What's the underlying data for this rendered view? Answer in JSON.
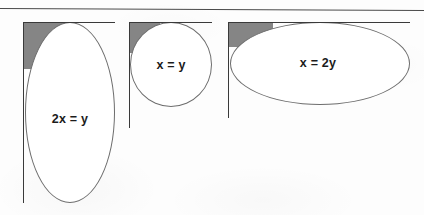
{
  "page": {
    "background_color": "#fdfdfd",
    "width": 424,
    "height": 215,
    "top_rule_color": "#4a4a4a"
  },
  "palette": {
    "bounding_box_grey": "#858585",
    "shape_fill": "#ffffff",
    "shape_outline": "#6d6d6d",
    "axis_line": "#3a3a3a",
    "label_text": "#1b1b1b"
  },
  "figures": [
    {
      "id": "tall-ellipse",
      "label": "2x = y",
      "description": "tall vertical ellipse with grey bounding corner",
      "axis_v": {
        "x": 23,
        "y": 22,
        "height": 181
      },
      "axis_h": {
        "x": 23,
        "y": 22,
        "width": 92
      },
      "bbox": {
        "x": 24,
        "y": 23,
        "width": 46,
        "height": 46
      },
      "shape": {
        "x": 25,
        "y": 22,
        "width": 90,
        "height": 181
      },
      "label_pos": {
        "x": 70,
        "y": 119
      }
    },
    {
      "id": "circle",
      "label": "x = y",
      "description": "circle with grey bounding corner",
      "axis_v": {
        "x": 129,
        "y": 22,
        "height": 106
      },
      "axis_h": {
        "x": 129,
        "y": 22,
        "width": 83
      },
      "bbox": {
        "x": 130,
        "y": 23,
        "width": 30,
        "height": 30
      },
      "shape": {
        "x": 130,
        "y": 22,
        "width": 82,
        "height": 85
      },
      "label_pos": {
        "x": 171,
        "y": 65
      }
    },
    {
      "id": "wide-ellipse",
      "label": "x = 2y",
      "description": "wide horizontal ellipse with grey bounding corner",
      "axis_v": {
        "x": 228,
        "y": 22,
        "height": 96
      },
      "axis_h": {
        "x": 228,
        "y": 22,
        "width": 182
      },
      "bbox": {
        "x": 229,
        "y": 23,
        "width": 44,
        "height": 24
      },
      "shape": {
        "x": 230,
        "y": 22,
        "width": 180,
        "height": 83
      },
      "label_pos": {
        "x": 318,
        "y": 63
      }
    }
  ]
}
